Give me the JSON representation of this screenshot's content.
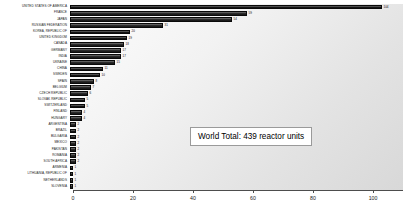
{
  "chart_data": {
    "type": "bar",
    "orientation": "horizontal",
    "title": "",
    "xlabel": "",
    "ylabel": "",
    "xlim": [
      0,
      110
    ],
    "xticks": [
      0,
      20,
      40,
      60,
      80,
      100
    ],
    "grid": false,
    "annotation": "World Total:  439 reactor units",
    "categories": [
      "UNITED STATES OF AMERICA",
      "FRANCE",
      "JAPAN",
      "RUSSIAN FEDERATION",
      "KOREA, REPUBLIC OF",
      "UNITED KINGDOM",
      "CANADA",
      "GERMANY",
      "INDIA",
      "UKRAINE",
      "CHINA",
      "SWEDEN",
      "SPAIN",
      "BELGIUM",
      "CZECH REPUBLIC",
      "SLOVAK REPUBLIC",
      "SWITZERLAND",
      "FINLAND",
      "HUNGARY",
      "ARGENTINA",
      "BRAZIL",
      "BULGARIA",
      "MEXICO",
      "PAKISTAN",
      "ROMANIA",
      "SOUTH AFRICA",
      "ARMENIA",
      "LITHUANIA, REPUBLIC OF",
      "NETHERLANDS",
      "SLOVENIA"
    ],
    "values": [
      104,
      59,
      54,
      31,
      20,
      19,
      18,
      17,
      17,
      15,
      11,
      10,
      8,
      7,
      6,
      5,
      5,
      4,
      4,
      2,
      2,
      2,
      2,
      2,
      2,
      2,
      1,
      1,
      1,
      1
    ],
    "bar_color": "#1a1a1a",
    "background_color": "#e8e8e8"
  }
}
